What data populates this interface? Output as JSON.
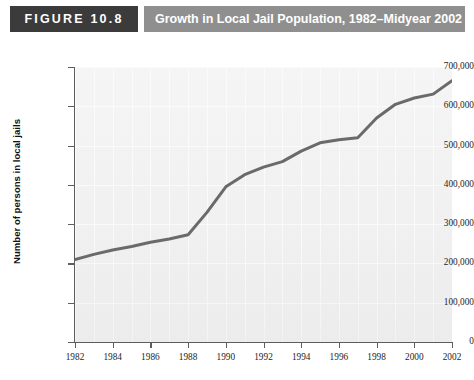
{
  "header": {
    "figure_badge": "FIGURE 10.8",
    "title": "Growth in Local Jail Population, 1982–Midyear 2002",
    "badge_color": "#3b3b3b",
    "title_bar_color": "#8f8f8f",
    "title_text_color": "#ffffff"
  },
  "chart_data": {
    "type": "line",
    "title": "Growth in Local Jail Population, 1982–Midyear 2002",
    "xlabel": "",
    "ylabel": "Number of persons in local jails",
    "xlim": [
      1982,
      2002
    ],
    "ylim": [
      0,
      700000
    ],
    "grid": true,
    "legend": null,
    "line_color": "#6a6a6a",
    "plot_background": "#f1f1f1",
    "gridline_color": "#ffffff",
    "axis_color": "#5d5d5d",
    "ytick_labels": [
      "0",
      "100,000",
      "200,000",
      "300,000",
      "400,000",
      "500,000",
      "600,000",
      "700,000"
    ],
    "ytick_values": [
      0,
      100000,
      200000,
      300000,
      400000,
      500000,
      600000,
      700000
    ],
    "xtick_labels": [
      "1982",
      "1984",
      "1986",
      "1988",
      "1990",
      "1992",
      "1994",
      "1996",
      "1998",
      "2000",
      "2002"
    ],
    "xtick_values": [
      1982,
      1984,
      1986,
      1988,
      1990,
      1992,
      1994,
      1996,
      1998,
      2000,
      2002
    ],
    "x": [
      1982,
      1983,
      1984,
      1985,
      1986,
      1987,
      1988,
      1989,
      1990,
      1991,
      1992,
      1993,
      1994,
      1995,
      1996,
      1997,
      1998,
      1999,
      2000,
      2001,
      2002
    ],
    "values": [
      210000,
      223000,
      234000,
      243000,
      254000,
      262000,
      273000,
      330000,
      395000,
      426000,
      445000,
      459000,
      486000,
      507000,
      515000,
      520000,
      570000,
      605000,
      621000,
      631000,
      665000
    ],
    "series": [
      {
        "name": "Local jail population",
        "values": [
          210000,
          223000,
          234000,
          243000,
          254000,
          262000,
          273000,
          330000,
          395000,
          426000,
          445000,
          459000,
          486000,
          507000,
          515000,
          520000,
          570000,
          605000,
          621000,
          631000,
          665000
        ]
      }
    ]
  }
}
